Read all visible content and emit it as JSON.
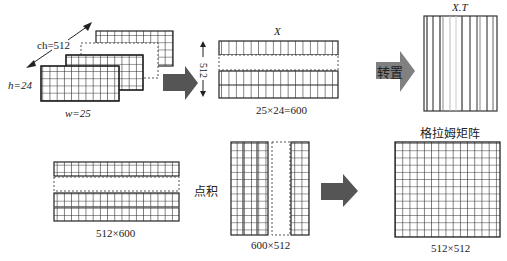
{
  "diagram": {
    "input_tensor": {
      "channels_label": "ch=512",
      "height_label": "h=24",
      "width_label": "w=25"
    },
    "reshaped_matrix": {
      "name": "X",
      "side_label": "512",
      "dims_label": "25×24=600"
    },
    "transpose_step": {
      "arrow_label": "转置",
      "result_name": "X.T"
    },
    "dot_product": {
      "left_dims_label": "512×600",
      "operator_label": "点积",
      "right_dims_label": "600×512"
    },
    "gram_matrix": {
      "title": "格拉姆矩阵",
      "dims_label": "512×512"
    },
    "colors": {
      "line": "#222222",
      "arrow_dark": "#555555",
      "arrow_light": "#808080",
      "dashed": "#555555"
    }
  }
}
